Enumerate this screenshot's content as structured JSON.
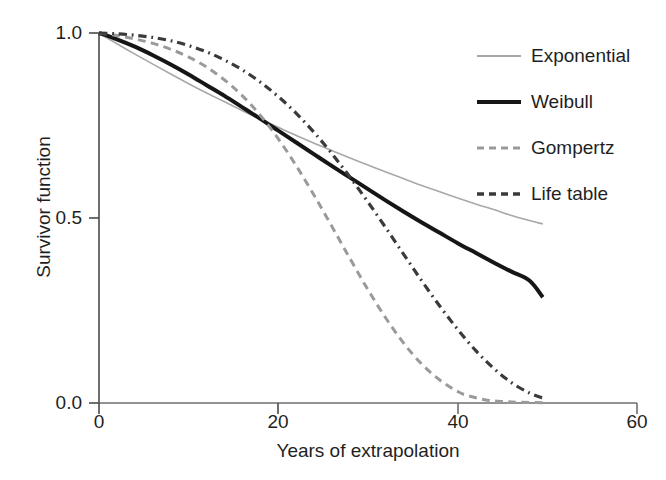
{
  "chart_data": {
    "type": "line",
    "title": "",
    "xlabel": "Years of extrapolation",
    "ylabel": "Survivor function",
    "xlim": [
      0,
      60
    ],
    "ylim": [
      0,
      1.0
    ],
    "xticks": [
      0,
      20,
      40,
      60
    ],
    "xtick_labels": [
      "0",
      "20",
      "40",
      "60"
    ],
    "yticks": [
      0.0,
      0.5,
      1.0
    ],
    "ytick_labels": [
      "0.0",
      "0.5",
      "1.0"
    ],
    "grid": false,
    "legend_position": "upper right",
    "series": [
      {
        "name": "Exponential",
        "color": "#a8a8a8",
        "style": "solid",
        "width": 1.6,
        "x": [
          0,
          2,
          4,
          6,
          8,
          10,
          12,
          14,
          16,
          18,
          20,
          22,
          24,
          26,
          28,
          30,
          32,
          34,
          36,
          38,
          40,
          42,
          44,
          46,
          48,
          49.5
        ],
        "y": [
          1.0,
          0.971,
          0.943,
          0.916,
          0.889,
          0.863,
          0.838,
          0.814,
          0.79,
          0.767,
          0.745,
          0.723,
          0.702,
          0.682,
          0.662,
          0.643,
          0.624,
          0.606,
          0.588,
          0.571,
          0.554,
          0.538,
          0.523,
          0.507,
          0.493,
          0.484
        ]
      },
      {
        "name": "Weibull",
        "color": "#161616",
        "style": "solid",
        "width": 4.0,
        "x": [
          0,
          2,
          4,
          6,
          8,
          10,
          12,
          14,
          16,
          18,
          20,
          22,
          24,
          26,
          28,
          30,
          32,
          34,
          36,
          38,
          40,
          42,
          44,
          46,
          48,
          49.5
        ],
        "y": [
          1.0,
          0.983,
          0.963,
          0.94,
          0.915,
          0.888,
          0.859,
          0.83,
          0.799,
          0.768,
          0.736,
          0.704,
          0.672,
          0.64,
          0.609,
          0.578,
          0.547,
          0.517,
          0.488,
          0.46,
          0.432,
          0.406,
          0.38,
          0.355,
          0.331,
          0.286
        ]
      },
      {
        "name": "Gompertz",
        "color": "#9a9a9a",
        "style": "dashed",
        "width": 3.0,
        "x": [
          0,
          2,
          4,
          6,
          8,
          10,
          12,
          14,
          16,
          18,
          20,
          22,
          24,
          26,
          28,
          30,
          32,
          34,
          36,
          38,
          40,
          41,
          43,
          45,
          47,
          49.5
        ],
        "y": [
          1.0,
          0.993,
          0.984,
          0.972,
          0.956,
          0.935,
          0.908,
          0.873,
          0.83,
          0.777,
          0.714,
          0.641,
          0.561,
          0.476,
          0.39,
          0.306,
          0.229,
          0.161,
          0.105,
          0.062,
          0.031,
          0.021,
          0.009,
          0.004,
          0.002,
          0.001
        ]
      },
      {
        "name": "Life table",
        "color": "#3a3a3a",
        "style": "dashdot",
        "width": 3.2,
        "x": [
          0,
          2,
          4,
          6,
          8,
          10,
          12,
          14,
          16,
          18,
          20,
          22,
          24,
          26,
          28,
          30,
          32,
          34,
          36,
          38,
          40,
          42,
          44,
          46,
          48,
          49.5
        ],
        "y": [
          1.0,
          0.998,
          0.994,
          0.988,
          0.979,
          0.966,
          0.949,
          0.927,
          0.9,
          0.867,
          0.828,
          0.783,
          0.731,
          0.673,
          0.61,
          0.543,
          0.473,
          0.401,
          0.33,
          0.262,
          0.199,
          0.142,
          0.094,
          0.055,
          0.027,
          0.013
        ]
      }
    ]
  },
  "axes": {
    "ytick_labels": [
      "1.0",
      "0.5",
      "0.0"
    ],
    "xtick_labels": [
      "0",
      "20",
      "40",
      "60"
    ],
    "ylabel": "Survivor function",
    "xlabel": "Years of extrapolation"
  },
  "legend": {
    "items": [
      {
        "label": "Exponential",
        "color": "#a8a8a8",
        "style": "solid",
        "width": 1.6
      },
      {
        "label": "Weibull",
        "color": "#161616",
        "style": "solid",
        "width": 4.0
      },
      {
        "label": "Gompertz",
        "color": "#9a9a9a",
        "style": "dashed",
        "width": 3.0
      },
      {
        "label": "Life table",
        "color": "#3a3a3a",
        "style": "dashdot",
        "width": 3.2
      }
    ]
  },
  "geometry": {
    "x0_px": 99,
    "x60_px": 637,
    "y1_px": 33,
    "y0_px": 403
  }
}
